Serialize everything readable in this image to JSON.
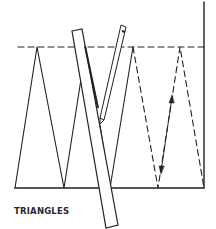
{
  "caption": "TRIANGLES",
  "colors": {
    "ink": "#222222",
    "background": "#ffffff"
  },
  "figure": {
    "elements": [
      "dashed-guide-line",
      "baseline",
      "right-border-line",
      "solid-zigzag-triangles",
      "dashed-zigzag-triangles",
      "ruler",
      "pencil",
      "double-headed-arrow"
    ]
  }
}
